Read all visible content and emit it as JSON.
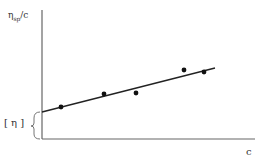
{
  "chart_data": {
    "type": "scatter",
    "title": "",
    "xlabel": "c",
    "ylabel": "η_sp/c",
    "ylabel_parts": {
      "main": "η",
      "sub": "sp",
      "rest": "/c"
    },
    "annotation": "[ η ]",
    "annotation_meaning": "y-intercept of linear fit",
    "grid": false,
    "legend": null,
    "axis_ticks": "none",
    "series": [
      {
        "name": "data points",
        "points_px": [
          [
            61,
            107
          ],
          [
            104,
            94
          ],
          [
            136,
            93
          ],
          [
            184,
            70
          ],
          [
            204,
            72
          ]
        ]
      },
      {
        "name": "linear fit",
        "type": "line",
        "line_px": [
          [
            42,
            112
          ],
          [
            215,
            68
          ]
        ]
      }
    ],
    "axes_px": {
      "origin": [
        42,
        139
      ],
      "y_top": 10,
      "x_right": 255
    }
  },
  "colors": {
    "ink": "#222222",
    "axis": "#666666",
    "background": "#ffffff"
  }
}
